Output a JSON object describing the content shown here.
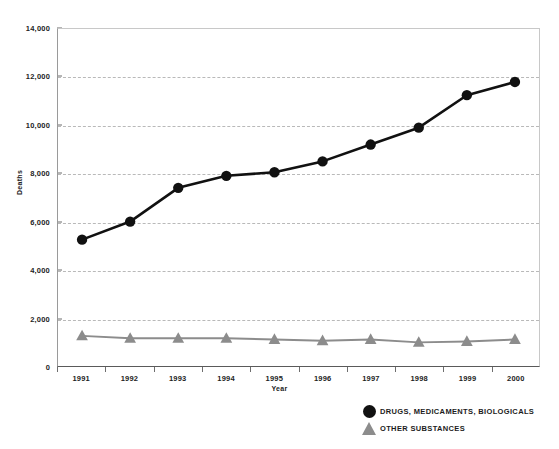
{
  "chart_data": {
    "type": "line",
    "title": "",
    "xlabel": "Year",
    "ylabel": "Deaths",
    "categories": [
      1991,
      1992,
      1993,
      1994,
      1995,
      1996,
      1997,
      1998,
      1999,
      2000
    ],
    "x_tick_labels": [
      "1991",
      "1992",
      "1993",
      "1994",
      "1995",
      "1996",
      "1997",
      "1998",
      "1999",
      "2000"
    ],
    "y_tick_labels": [
      "0",
      "2,000",
      "4,000",
      "6,000",
      "8,000",
      "10,000",
      "12,000",
      "14,000"
    ],
    "y_ticks": [
      0,
      2000,
      4000,
      6000,
      8000,
      10000,
      12000,
      14000
    ],
    "ylim": [
      0,
      14000
    ],
    "grid": true,
    "legend_position": "bottom-right",
    "series": [
      {
        "name": "DRUGS, MEDICAMENTS, BIOLOGICALS",
        "marker": "circle",
        "color": "#111111",
        "values": [
          5250,
          6000,
          7400,
          7900,
          8050,
          8500,
          9200,
          9900,
          11250,
          11800
        ]
      },
      {
        "name": "OTHER SUBSTANCES",
        "marker": "triangle",
        "color": "#8c8c8c",
        "values": [
          1250,
          1150,
          1150,
          1150,
          1100,
          1050,
          1100,
          980,
          1020,
          1100
        ]
      }
    ]
  },
  "legend": {
    "items": [
      {
        "label": "DRUGS, MEDICAMENTS, BIOLOGICALS",
        "marker": "circle-marker"
      },
      {
        "label": "OTHER SUBSTANCES",
        "marker": "triangle-marker"
      }
    ]
  },
  "colors": {
    "series_primary": "#111111",
    "series_secondary": "#8c8c8c",
    "gridline": "#b9b9b9",
    "axis": "#5a5a5a",
    "text": "#232323",
    "background": "#ffffff"
  }
}
